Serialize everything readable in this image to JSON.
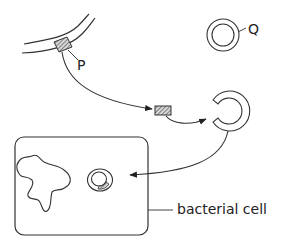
{
  "labels": {
    "p": "P",
    "q": "Q",
    "bacterial_cell": "bacterial cell"
  },
  "colors": {
    "stroke": "#333333",
    "hatch": "#555555",
    "hatch_fill": "#d0d0d0"
  },
  "elements": [
    "donor DNA strand with gene segment P",
    "plasmid Q (closed ring)",
    "excised gene fragment",
    "opened plasmid ring",
    "bacterial cell containing chromosome and recombinant plasmid"
  ]
}
